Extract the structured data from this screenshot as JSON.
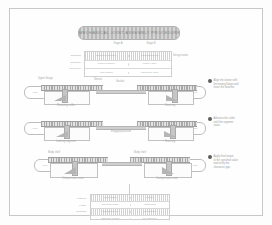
{
  "document": {
    "title": "ASSEMBLY SEQUENCE DIAGRAM",
    "frame_color": "#c8c8c8",
    "background": "#fdfdfd"
  },
  "title_banner": {
    "text": "MECHANICAL JOINT ASSEMBLY PROCEDURE"
  },
  "top_captions": {
    "left": "Stage A",
    "right": "Stage B"
  },
  "top_table": {
    "side_labels": [
      "Condition",
      "Tolerance",
      "Reference"
    ],
    "right_label": "Design notes",
    "rows": [
      {
        "cells": [
          "nominal clearance",
          "preload applied"
        ]
      },
      {
        "cells": [
          "seated position",
          "torque value"
        ]
      },
      {
        "cells": [
          "final setting",
          "inspection mark"
        ]
      }
    ]
  },
  "assemblies": [
    {
      "name": "Step 1",
      "left_cap": "Port",
      "right_cap": "Port",
      "top_labels": [
        "Upper flange",
        "Sleeve",
        "Gasket"
      ],
      "bottom_labels": [
        "Retaining collar",
        "Seat ring"
      ],
      "center_label": ""
    },
    {
      "name": "Step 2",
      "left_cap": "Port",
      "right_cap": "Port",
      "top_labels": [],
      "bottom_labels": [
        "Locking segment",
        "Seat ring"
      ],
      "center_label": "Engaged position"
    },
    {
      "name": "Step 3",
      "left_cap": "Port",
      "right_cap": "Port",
      "top_labels": [
        "Body shell",
        "Body shell"
      ],
      "bottom_labels": [
        "Compression zone",
        "Compression zone"
      ],
      "center_label": ""
    }
  ],
  "callouts": [
    {
      "marker": "1",
      "lines": [
        "Align the sleeve with",
        "the mating flange and",
        "insert the fastener."
      ]
    },
    {
      "marker": "2",
      "lines": [
        "Advance the collar",
        "until the segment",
        "seats."
      ]
    },
    {
      "marker": "3",
      "lines": [
        "Apply final torque",
        "to the specified value",
        "and verify the",
        "clearance gap."
      ]
    }
  ],
  "bottom_table": {
    "side_labels": [
      "Material",
      "Finish",
      "Remarks"
    ],
    "rows": [
      {
        "cells": [
          "carbon steel",
          "plated"
        ]
      },
      {
        "cells": [
          "stainless grade",
          "passivated"
        ]
      },
      {
        "cells": [
          "elastomer seal",
          "as supplied"
        ]
      },
      {
        "cells": [
          "assembly torque",
          "per schedule"
        ]
      }
    ]
  }
}
